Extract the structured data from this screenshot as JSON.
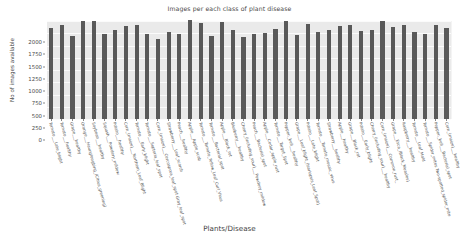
{
  "chart_data": {
    "type": "bar",
    "title": "Images per each class of plant disease",
    "xlabel": "Plants/Disease",
    "ylabel": "No of images available",
    "ylim": [
      0,
      2000
    ],
    "yticks": [
      0,
      250,
      500,
      750,
      1000,
      1250,
      1500,
      1750,
      2000
    ],
    "grid": true,
    "legend": false,
    "bar_color": "#595959",
    "plot_background": "#eaeaea",
    "categories": [
      "Tomato___Late_blight",
      "Tomato___healthy",
      "Grape___healthy",
      "Orange___Haunglongbing_(Citrus_greening)",
      "Soybean___healthy",
      "Squash___Powdery_mildew",
      "Potato___healthy",
      "Corn_(maize)___Northern_Leaf_Blight",
      "Tomato___Early_blight",
      "Tomato___Septoria_leaf_spot",
      "Corn_(maize)___Cercospora_leaf_spot Gray_leaf_spot",
      "Strawberry___Leaf_scorch",
      "Peach___healthy",
      "Apple___Apple_scab",
      "Tomato___Tomato_Yellow_Leaf_Curl_Virus",
      "Tomato___Bacterial_spot",
      "Apple___Black_rot",
      "Blueberry___healthy",
      "Cherry_(including_sour)___Powdery_mildew",
      "Peach___Bacterial_spot",
      "Apple___Cedar_apple_rust",
      "Tomato___Target_Spot",
      "Pepper,_bell___healthy",
      "Grape___Leaf_blight_(Isariopsis_Leaf_Spot)",
      "Potato___Late_blight",
      "Tomato___Tomato_mosaic_virus",
      "Strawberry___healthy",
      "Apple___healthy",
      "Grape___Black_rot",
      "Potato___Early_blight",
      "Cherry_(including_sour)___healthy",
      "Corn_(maize)___Common_rust_",
      "Grape___Esca_(Black_Measles)",
      "Raspberry___healthy",
      "Tomato___Leaf_Mold",
      "Tomato___Spider_mites Two-spotted_spider_mite",
      "Pepper,_bell___Bacterial_spot",
      "Corn_(maize)___healthy"
    ],
    "values": [
      1851,
      1926,
      1692,
      2010,
      2010,
      1736,
      1824,
      1908,
      1926,
      1745,
      1642,
      1774,
      1728,
      2016,
      1961,
      1702,
      1987,
      1816,
      1683,
      1728,
      1760,
      1827,
      2010,
      1722,
      1929,
      1771,
      1824,
      1900,
      1920,
      1806,
      1826,
      2010,
      1888,
      1920,
      1781,
      1741,
      1913,
      1859
    ]
  }
}
